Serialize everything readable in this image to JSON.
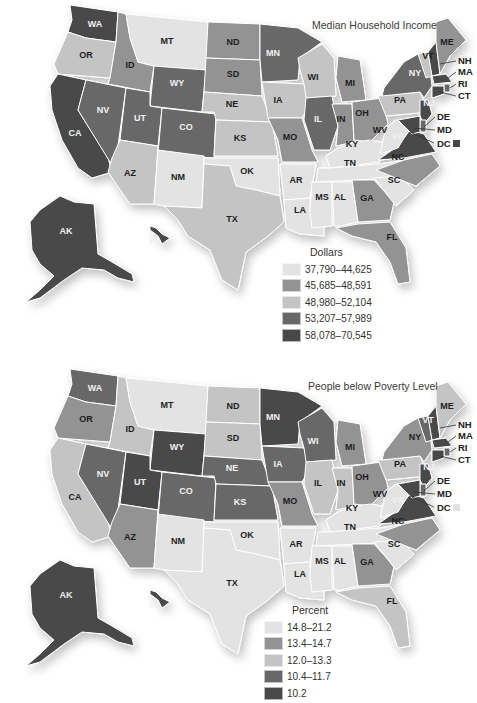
{
  "chart_data": [
    {
      "type": "choropleth",
      "title": "Median Household Income",
      "legend_title": "Dollars",
      "legend_position": "bottom-center",
      "classes": [
        {
          "label": "37,790–44,625",
          "color": "#e3e3e3"
        },
        {
          "label": "45,685–48,591",
          "color": "#939393"
        },
        {
          "label": "48,980–52,104",
          "color": "#c4c4c4"
        },
        {
          "label": "53,207–57,989",
          "color": "#686868"
        },
        {
          "label": "58,078–70,545",
          "color": "#484848"
        }
      ],
      "states": {
        "WA": 4,
        "OR": 2,
        "CA": 4,
        "ID": 1,
        "NV": 3,
        "MT": 0,
        "WY": 3,
        "UT": 3,
        "CO": 3,
        "AZ": 2,
        "NM": 0,
        "ND": 1,
        "SD": 1,
        "NE": 2,
        "KS": 2,
        "OK": 0,
        "TX": 2,
        "MN": 3,
        "IA": 2,
        "MO": 1,
        "AR": 0,
        "LA": 0,
        "WI": 2,
        "IL": 3,
        "MI": 1,
        "IN": 1,
        "OH": 1,
        "KY": 0,
        "TN": 0,
        "MS": 0,
        "AL": 0,
        "GA": 1,
        "FL": 1,
        "SC": 0,
        "NC": 1,
        "VA": 4,
        "WV": 0,
        "PA": 2,
        "NY": 3,
        "VT": 2,
        "NH": 4,
        "ME": 1,
        "MA": 4,
        "RI": 3,
        "CT": 4,
        "NJ": 4,
        "DE": 3,
        "MD": 4,
        "DC": 4,
        "AK": 4,
        "HI": 4
      }
    },
    {
      "type": "choropleth",
      "title": "People below Poverty Level",
      "legend_title": "Percent",
      "legend_position": "bottom-center",
      "classes": [
        {
          "label": "14.8–21.2",
          "color": "#e3e3e3"
        },
        {
          "label": "13.4–14.7",
          "color": "#939393"
        },
        {
          "label": "12.0–13.3",
          "color": "#c4c4c4"
        },
        {
          "label": "10.4–11.7",
          "color": "#686868"
        },
        {
          "label": "10.2",
          "color": "#484848"
        }
      ],
      "states": {
        "WA": 3,
        "OR": 1,
        "CA": 2,
        "ID": 2,
        "NV": 3,
        "MT": 0,
        "WY": 4,
        "UT": 4,
        "CO": 3,
        "AZ": 1,
        "NM": 0,
        "ND": 2,
        "SD": 2,
        "NE": 3,
        "KS": 3,
        "OK": 0,
        "TX": 0,
        "MN": 4,
        "IA": 3,
        "MO": 1,
        "AR": 0,
        "LA": 0,
        "WI": 3,
        "IL": 2,
        "MI": 1,
        "IN": 2,
        "OH": 1,
        "KY": 0,
        "TN": 0,
        "MS": 0,
        "AL": 0,
        "GA": 1,
        "FL": 2,
        "SC": 0,
        "NC": 1,
        "VA": 4,
        "WV": 0,
        "PA": 2,
        "NY": 1,
        "VT": 3,
        "NH": 4,
        "ME": 2,
        "MA": 4,
        "RI": 3,
        "CT": 4,
        "NJ": 4,
        "DE": 3,
        "MD": 4,
        "DC": 0,
        "AK": 4,
        "HI": 4
      }
    }
  ],
  "maps": [
    {
      "title": "Median Household Income",
      "legend": {
        "title": "Dollars",
        "items": [
          "37,790–44,625",
          "45,685–48,591",
          "48,980–52,104",
          "53,207–57,989",
          "58,078–70,545"
        ]
      },
      "dc_label": "DC"
    },
    {
      "title": "People below Poverty Level",
      "legend": {
        "title": "Percent",
        "items": [
          "14.8–21.2",
          "13.4–14.7",
          "12.0–13.3",
          "10.4–11.7",
          "10.2"
        ]
      },
      "dc_label": "DC"
    }
  ],
  "northeast_callouts": [
    "NH",
    "MA",
    "RI",
    "CT",
    "DE",
    "MD"
  ],
  "colors": [
    "#e3e3e3",
    "#939393",
    "#c4c4c4",
    "#686868",
    "#484848"
  ]
}
